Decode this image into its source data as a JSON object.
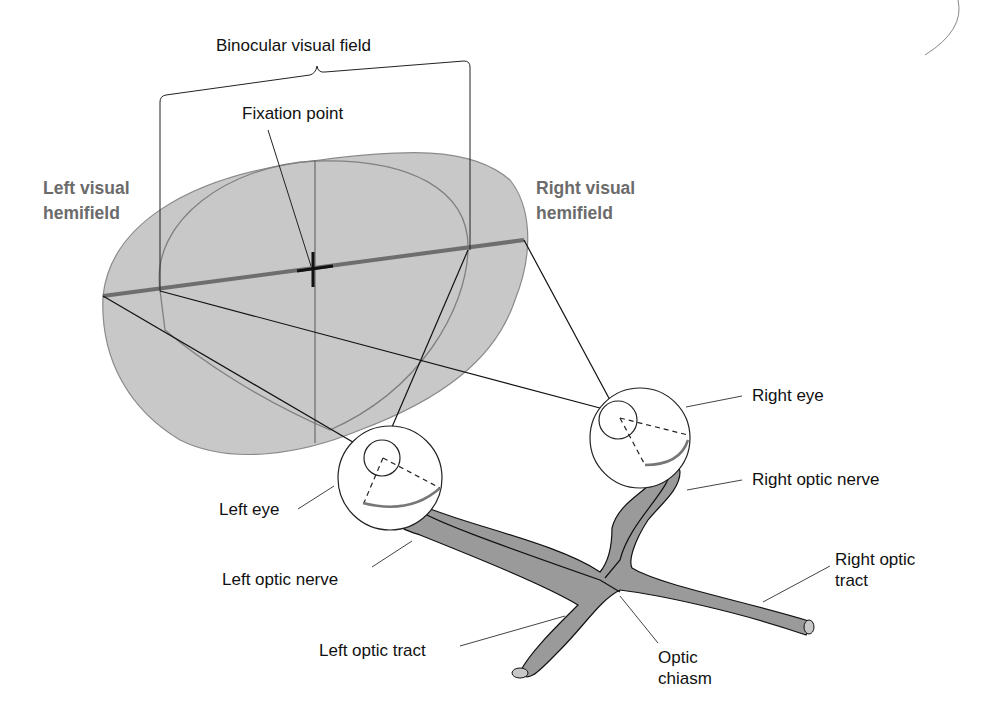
{
  "diagram": {
    "labels": {
      "binocular_visual_field": "Binocular visual field",
      "fixation_point": "Fixation point",
      "left_hemifield_line1": "Left visual",
      "left_hemifield_line2": "hemifield",
      "right_hemifield_line1": "Right visual",
      "right_hemifield_line2": "hemifield",
      "right_eye": "Right eye",
      "right_optic_nerve": "Right optic nerve",
      "left_eye": "Left eye",
      "left_optic_nerve": "Left optic nerve",
      "right_optic_tract_line1": "Right optic",
      "right_optic_tract_line2": "tract",
      "left_optic_tract": "Left optic tract",
      "optic_chiasm_line1": "Optic",
      "optic_chiasm_line2": "chiasm"
    },
    "colors": {
      "field_fill": "#c8c8c8",
      "field_outline": "#8a8a8a",
      "horizon_line": "#6e6e6e",
      "nerve_fill": "#9a9a9a",
      "hemifield_label": "#6b6b6b",
      "ink": "#111111"
    }
  }
}
